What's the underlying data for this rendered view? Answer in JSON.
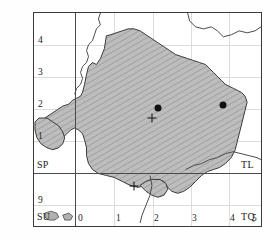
{
  "map": {
    "title": "Ordnance Survey grid distribution map",
    "projection_note": "British National Grid 10km squares",
    "frame": {
      "left": 33,
      "top": 12,
      "width": 229,
      "height": 215
    },
    "fill_color": "#b6b6b6",
    "hatch_color": "#8f8f8f",
    "outline_color": "#333333",
    "grid_color": "#dcdcdc",
    "heavy_grid_color": "#4a4a4a",
    "marker_color": "#111111"
  },
  "grid": {
    "heavy_vertical_x": 74.5,
    "heavy_horizontal_y": 172.5,
    "light_vertical_x": [
      113,
      152,
      190,
      228
    ],
    "light_horizontal_y": [
      44,
      76,
      108,
      140,
      204
    ]
  },
  "axes": {
    "x_ticks": [
      {
        "label": "0",
        "x": 78
      },
      {
        "label": "1",
        "x": 116
      },
      {
        "label": "2",
        "x": 154
      },
      {
        "label": "3",
        "x": 192
      },
      {
        "label": "4",
        "x": 230
      },
      {
        "label": "5",
        "x": 256
      }
    ],
    "y_ticks": [
      {
        "label": "4",
        "y": 40
      },
      {
        "label": "3",
        "y": 72
      },
      {
        "label": "2",
        "y": 104
      },
      {
        "label": "1",
        "y": 136
      },
      {
        "label": "9",
        "y": 200
      }
    ]
  },
  "square_labels": [
    {
      "name": "SP",
      "text": "SP",
      "x": 38,
      "y": 163
    },
    {
      "name": "TL",
      "text": "TL",
      "x": 240,
      "y": 163
    },
    {
      "name": "SU",
      "text": "SU",
      "x": 38,
      "y": 215
    },
    {
      "name": "TQ",
      "text": "TQ",
      "x": 240,
      "y": 215
    }
  ],
  "markers": {
    "dots": [
      {
        "name": "record-dot-1",
        "x": 157,
        "y": 107
      },
      {
        "name": "record-dot-2",
        "x": 222,
        "y": 104
      }
    ],
    "crosses": [
      {
        "name": "record-cross-1",
        "x": 151,
        "y": 117
      },
      {
        "name": "record-cross-2",
        "x": 133,
        "y": 185
      }
    ]
  },
  "shapes": {
    "shaded_region_path": "M 106 35 L 104 48 L 100 58 L 96 64 L 92 62 L 88 66 L 86 74 L 84 84 L 82 92 L 80 96 L 76 98 L 72 100 L 68 104 L 62 106 L 56 110 L 50 114 L 44 118 L 40 124 L 38 130 L 40 136 L 44 140 L 50 142 L 56 140 L 62 138 L 66 134 L 70 130 L 74 128 L 78 130 L 82 134 L 84 140 L 86 148 L 86 156 L 88 164 L 92 170 L 98 174 L 106 176 L 114 178 L 122 182 L 130 186 L 138 188 L 146 186 L 152 182 L 158 180 L 164 182 L 168 188 L 172 192 L 178 194 L 184 192 L 190 188 L 196 182 L 202 176 L 208 172 L 214 170 L 220 168 L 226 164 L 232 158 L 236 150 L 238 142 L 240 134 L 242 126 L 244 118 L 246 110 L 248 102 L 246 96 L 242 92 L 238 90 L 234 88 L 230 86 L 226 84 L 222 80 L 218 76 L 214 72 L 210 68 L 206 64 L 200 62 L 194 60 L 188 58 L 182 56 L 176 54 L 170 50 L 164 46 L 158 42 L 152 38 L 146 34 L 140 30 L 134 28 L 128 28 L 122 30 L 116 32 L 110 34 Z",
    "peninsula_west_path": "M 38 118 L 34 122 L 34 130 L 36 138 L 40 144 L 46 148 L 52 150 L 58 148 L 62 144 L 64 138 L 62 132 L 58 126 L 52 122 L 46 118 Z",
    "coast_lines": [
      "M 100 12 L 98 18 L 100 24 L 96 28 L 94 34 L 92 40 L 88 44 L 86 50 L 88 56 L 86 62 L 82 66 L 80 72 L 82 78 L 80 84 L 76 88 L 74 94",
      "M 188 12 L 190 20 L 196 26 L 204 28 L 212 26 L 218 30 L 224 36 L 232 34 L 240 30 L 248 32 L 256 30 L 262 26",
      "M 186 170 L 194 166 L 202 164 L 210 160 L 218 158 L 226 154 L 234 152 L 242 154 L 250 156 L 258 158 L 262 160",
      "M 150 176 L 152 186 L 150 196 L 146 206 L 142 216 L 140 224"
    ]
  }
}
